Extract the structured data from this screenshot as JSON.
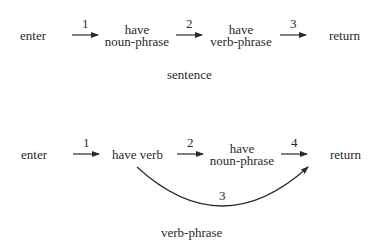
{
  "diagrams": [
    {
      "name": "sentence",
      "caption": "sentence",
      "nodes": [
        {
          "id": "enter",
          "label": "enter"
        },
        {
          "id": "np",
          "label_line1": "have",
          "label_line2": "noun-phrase"
        },
        {
          "id": "vp",
          "label_line1": "have",
          "label_line2": "verb-phrase"
        },
        {
          "id": "return",
          "label": "return"
        }
      ],
      "edges": [
        {
          "from": "enter",
          "to": "np",
          "label": "1"
        },
        {
          "from": "np",
          "to": "vp",
          "label": "2"
        },
        {
          "from": "vp",
          "to": "return",
          "label": "3"
        }
      ]
    },
    {
      "name": "verb-phrase",
      "caption": "verb-phrase",
      "nodes": [
        {
          "id": "enter",
          "label": "enter"
        },
        {
          "id": "verb",
          "label": "have verb"
        },
        {
          "id": "np",
          "label_line1": "have",
          "label_line2": "noun-phrase"
        },
        {
          "id": "return",
          "label": "return"
        }
      ],
      "edges": [
        {
          "from": "enter",
          "to": "verb",
          "label": "1"
        },
        {
          "from": "verb",
          "to": "np",
          "label": "2"
        },
        {
          "from": "np",
          "to": "return",
          "label": "4"
        },
        {
          "from": "verb",
          "to": "return",
          "label": "3",
          "curved": true
        }
      ]
    }
  ]
}
